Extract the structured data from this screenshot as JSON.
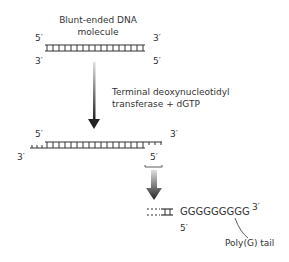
{
  "step1": {
    "title_line1": "Blunt-ended DNA",
    "title_line2": "molecule",
    "top_left": "5′",
    "top_right": "3′",
    "bottom_left": "3′",
    "bottom_right": "5′"
  },
  "reaction": {
    "line1": "Terminal deoxynucleotidyl",
    "line2": "transferase + dGTP"
  },
  "step2": {
    "top_left": "5′",
    "top_right": "3′",
    "bottom_left": "3′",
    "bottom_right": "5′"
  },
  "step3": {
    "tail_sequence": "GGGGGGGGG",
    "tail_end": "3′",
    "bottom_label": "5′",
    "callout": "Poly(G) tail"
  },
  "colors": {
    "strand": "#333333",
    "text": "#333333",
    "arrow_light": "#cccccc",
    "arrow_dark": "#222222"
  }
}
